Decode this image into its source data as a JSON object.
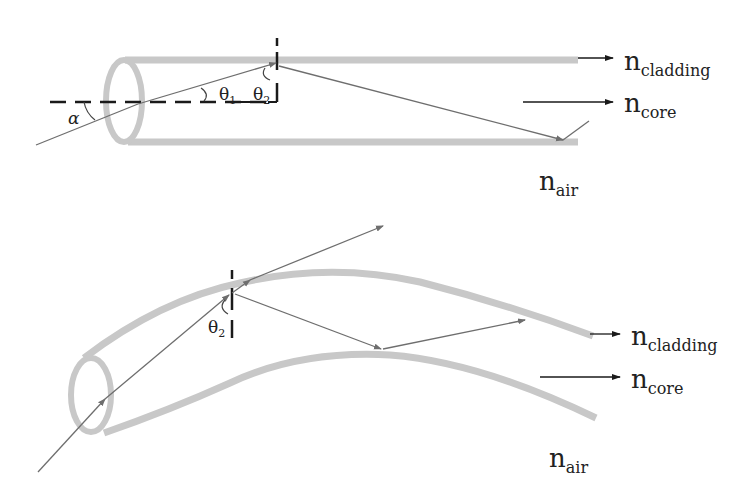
{
  "diagram": {
    "colors": {
      "fiber_wall": "#c8c8c8",
      "ray": "#6e6e6e",
      "axis_dash": "#1a1a1a",
      "label_text": "#222222",
      "background": "#ffffff"
    },
    "top": {
      "labels": {
        "cladding_n": "n",
        "cladding_sub": "cladding",
        "core_n": "n",
        "core_sub": "core",
        "air_n": "n",
        "air_sub": "air",
        "alpha": "α",
        "theta1": "θ",
        "theta1_sub": "1",
        "theta2": "θ",
        "theta2_sub": "2"
      }
    },
    "bottom": {
      "labels": {
        "cladding_n": "n",
        "cladding_sub": "cladding",
        "core_n": "n",
        "core_sub": "core",
        "air_n": "n",
        "air_sub": "air",
        "theta2": "θ",
        "theta2_sub": "2"
      }
    }
  }
}
